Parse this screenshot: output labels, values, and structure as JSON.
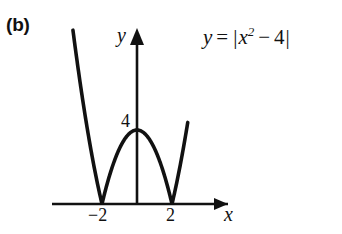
{
  "figure": {
    "part_label": "(b)",
    "equation": {
      "lhs": "y",
      "equals": "=",
      "abs_open": "|",
      "base": "x",
      "exponent": "2",
      "minus": "−",
      "constant": "4",
      "abs_close": "|",
      "full_text": "y = |x² − 4|"
    },
    "axes": {
      "x_label": "x",
      "y_label": "y"
    },
    "tick_labels": {
      "x_neg2": "−2",
      "x_pos2": "2",
      "y_four": "4"
    },
    "colors": {
      "curve": "#111111",
      "axis": "#111111",
      "background": "#ffffff",
      "text": "#111111"
    }
  },
  "chart_data": {
    "type": "line",
    "title": "",
    "subtitle": "",
    "annotations": [
      "(b)",
      "y = |x² − 4|"
    ],
    "xlabel": "x",
    "ylabel": "y",
    "xlim": [
      -4.6,
      2.9
    ],
    "ylim": [
      -0.4,
      9.4
    ],
    "grid": false,
    "legend": null,
    "function": "y = |x^2 - 4|",
    "x_ticks": [
      -2,
      2
    ],
    "x_tick_labels": [
      "−2",
      "2"
    ],
    "y_ticks": [
      4
    ],
    "y_tick_labels": [
      "4"
    ],
    "zeros": [
      -2,
      2
    ],
    "local_maximum": {
      "x": 0,
      "y": 4
    },
    "series": [
      {
        "name": "y = |x² − 4|",
        "x": [
          -3.5,
          -3.25,
          -3.0,
          -2.75,
          -2.5,
          -2.25,
          -2.0,
          -1.75,
          -1.5,
          -1.25,
          -1.0,
          -0.75,
          -0.5,
          -0.25,
          0.0,
          0.25,
          0.5,
          0.75,
          1.0,
          1.25,
          1.5,
          1.75,
          2.0,
          2.25,
          2.5,
          2.75,
          3.0
        ],
        "y": [
          8.25,
          6.5625,
          5.0,
          3.5625,
          2.25,
          1.0625,
          0.0,
          0.9375,
          1.75,
          2.4375,
          3.0,
          3.4375,
          3.75,
          3.9375,
          4.0,
          3.9375,
          3.75,
          3.4375,
          3.0,
          2.4375,
          1.75,
          0.9375,
          0.0,
          1.0625,
          2.25,
          3.5625,
          5.0
        ]
      }
    ]
  }
}
